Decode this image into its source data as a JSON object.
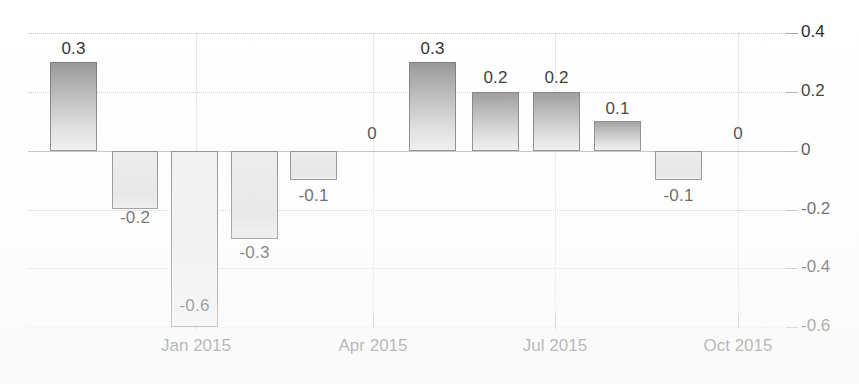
{
  "chart_data": {
    "type": "bar",
    "title": "",
    "subtitle": "",
    "xlabel": "",
    "ylabel": "",
    "grid": true,
    "legend": "none",
    "ylim": [
      -0.6,
      0.4
    ],
    "yticks": [
      0.4,
      0.2,
      0,
      -0.2,
      -0.4,
      -0.6
    ],
    "ytick_labels": [
      "0.4",
      "0.2",
      "0",
      "-0.2",
      "-0.4",
      "-0.6"
    ],
    "xtick_labels": [
      "Jan 2015",
      "Apr 2015",
      "Jul 2015",
      "Oct 2015"
    ],
    "categories": [
      "Nov 2014",
      "Dec 2014",
      "Jan 2015",
      "Feb 2015",
      "Mar 2015",
      "Apr 2015",
      "May 2015",
      "Jun 2015",
      "Jul 2015",
      "Aug 2015",
      "Sep 2015",
      "Oct 2015"
    ],
    "values": [
      0.3,
      -0.2,
      -0.6,
      -0.3,
      -0.1,
      0,
      0.3,
      0.2,
      0.2,
      0.1,
      -0.1,
      0
    ],
    "data_labels": [
      "0.3",
      "-0.2",
      "-0.6",
      "-0.3",
      "-0.1",
      "0",
      "0.3",
      "0.2",
      "0.2",
      "0.1",
      "-0.1",
      "0"
    ],
    "bars": [
      {
        "label": "0.3",
        "value": 0.3,
        "x": 50,
        "w": 47,
        "sign": "pos",
        "label_x": 50,
        "label_y": 39,
        "label_w": 47
      },
      {
        "label": "-0.2",
        "value": -0.2,
        "x": 112,
        "w": 46,
        "sign": "neg",
        "label_x": 107,
        "label_y": 208,
        "label_w": 56
      },
      {
        "label": "-0.6",
        "value": -0.6,
        "x": 171,
        "w": 47,
        "sign": "neg",
        "label_x": 166,
        "label_y": 296,
        "label_w": 57
      },
      {
        "label": "-0.3",
        "value": -0.3,
        "x": 231,
        "w": 47,
        "sign": "neg",
        "label_x": 226,
        "label_y": 243,
        "label_w": 57
      },
      {
        "label": "-0.1",
        "value": -0.1,
        "x": 290,
        "w": 47,
        "sign": "neg",
        "label_x": 285,
        "label_y": 186,
        "label_w": 57
      },
      {
        "label": "0.3",
        "value": 0.3,
        "x": 409,
        "w": 47,
        "sign": "pos",
        "label_x": 409,
        "label_y": 39,
        "label_w": 47
      },
      {
        "label": "0.2",
        "value": 0.2,
        "x": 472,
        "w": 47,
        "sign": "pos",
        "label_x": 472,
        "label_y": 68,
        "label_w": 47
      },
      {
        "label": "0.2",
        "value": 0.2,
        "x": 533,
        "w": 47,
        "sign": "pos",
        "label_x": 533,
        "label_y": 68,
        "label_w": 47
      },
      {
        "label": "0.1",
        "value": 0.1,
        "x": 594,
        "w": 47,
        "sign": "pos",
        "label_x": 594,
        "label_y": 99,
        "label_w": 47
      },
      {
        "label": "-0.1",
        "value": -0.1,
        "x": 655,
        "w": 47,
        "sign": "neg",
        "label_x": 650,
        "label_y": 186,
        "label_w": 57
      }
    ],
    "zero_annotations": [
      {
        "label": "0",
        "x": 358,
        "y": 124,
        "w": 28
      },
      {
        "label": "0",
        "x": 724,
        "y": 124,
        "w": 28
      }
    ],
    "ytick_positions": [
      {
        "label": "0.4",
        "y": 33
      },
      {
        "label": "0.2",
        "y": 92
      },
      {
        "label": "0",
        "y": 151
      },
      {
        "label": "-0.2",
        "y": 210
      },
      {
        "label": "-0.4",
        "y": 268
      },
      {
        "label": "-0.6",
        "y": 327
      }
    ],
    "xtick_positions": [
      {
        "label": "Jan 2015",
        "x": 196
      },
      {
        "label": "Apr 2015",
        "x": 373
      },
      {
        "label": "Jul 2015",
        "x": 555
      },
      {
        "label": "Oct 2015",
        "x": 738
      }
    ],
    "colors": {
      "bar_positive_top": "#8c8c8c",
      "bar_positive_bottom": "#eaeaea",
      "bar_negative": "#e6e6e6",
      "bar_outline": "#6e6e6e",
      "gridline": "#b9b9b9",
      "text": "#1b1b1b",
      "background": "#ffffff"
    }
  }
}
